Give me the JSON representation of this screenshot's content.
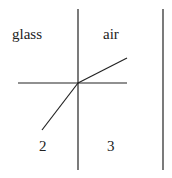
{
  "diagram": {
    "labels": {
      "medium_left": "glass",
      "medium_right": "air",
      "region_2": "2",
      "region_3": "3"
    },
    "elements": {
      "interface_line": "vertical boundary between glass and air",
      "normal_line": "horizontal normal through point of incidence",
      "incident_ray": "ray in glass toward point of incidence",
      "refracted_ray": "ray bent away from normal in air",
      "right_boundary": "vertical line at right"
    },
    "colors": {
      "line": "#222222",
      "background": "#ffffff"
    }
  }
}
